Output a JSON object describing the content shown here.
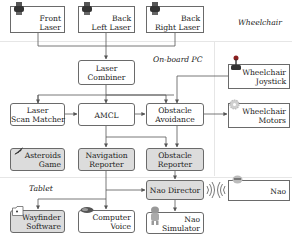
{
  "regions": {
    "wheelchair": "Wheelchair",
    "onboard_pc": "On-board PC",
    "tablet": "Tablet"
  },
  "nodes": {
    "front_laser": {
      "label": "Front\nLaser",
      "icon": "laser-sensor-icon"
    },
    "back_left_laser": {
      "label": "Back\nLeft Laser",
      "icon": "laser-sensor-icon"
    },
    "back_right_laser": {
      "label": "Back\nRight Laser",
      "icon": "laser-sensor-icon"
    },
    "laser_combiner": {
      "label": "Laser\nCombiner"
    },
    "wheelchair_joystick": {
      "label": "Wheelchair\nJoystick",
      "icon": "joystick-icon"
    },
    "laser_scan_matcher": {
      "label": "Laser\nScan Matcher"
    },
    "amcl": {
      "label": "AMCL"
    },
    "obstacle_avoidance": {
      "label": "Obstacle\nAvoidance"
    },
    "wheelchair_motors": {
      "label": "Wheelchair\nMotors",
      "icon": "gear-icon"
    },
    "asteroids_game": {
      "label": "Asteroids\nGame",
      "icon": "spaceship-icon"
    },
    "navigation_reporter": {
      "label": "Navigation\nReporter"
    },
    "obstacle_reporter": {
      "label": "Obstacle\nReporter"
    },
    "nao_director": {
      "label": "Nao Director"
    },
    "nao": {
      "label": "Nao",
      "icon": "robot-head-icon"
    },
    "wayfinder_software": {
      "label": "Wayfinder\nSoftware",
      "icon": "folder-icon"
    },
    "computer_voice": {
      "label": "Computer\nVoice",
      "icon": "speaker-icon"
    },
    "nao_simulator": {
      "label": "Nao\nSimulator",
      "icon": "robot-figure-icon"
    }
  },
  "edges": [
    [
      "front_laser",
      "laser_combiner"
    ],
    [
      "back_left_laser",
      "laser_combiner"
    ],
    [
      "back_right_laser",
      "laser_combiner"
    ],
    [
      "laser_combiner",
      "laser_scan_matcher"
    ],
    [
      "laser_combiner",
      "amcl"
    ],
    [
      "laser_combiner",
      "obstacle_avoidance"
    ],
    [
      "wheelchair_joystick",
      "obstacle_avoidance"
    ],
    [
      "laser_scan_matcher",
      "amcl"
    ],
    [
      "amcl",
      "obstacle_avoidance"
    ],
    [
      "obstacle_avoidance",
      "wheelchair_motors"
    ],
    [
      "amcl",
      "navigation_reporter"
    ],
    [
      "amcl",
      "obstacle_reporter"
    ],
    [
      "obstacle_avoidance",
      "obstacle_reporter"
    ],
    [
      "navigation_reporter",
      "wayfinder_software"
    ],
    [
      "navigation_reporter",
      "computer_voice"
    ],
    [
      "navigation_reporter",
      "nao_director"
    ],
    [
      "obstacle_reporter",
      "nao_director"
    ],
    [
      "nao_director",
      "nao_simulator"
    ],
    [
      "nao_director",
      "nao"
    ]
  ],
  "colors": {
    "border": "#6a6a6a",
    "edge": "#555555",
    "gray_fill": "#dcdcdc",
    "region_line": "#e6e6e6"
  }
}
